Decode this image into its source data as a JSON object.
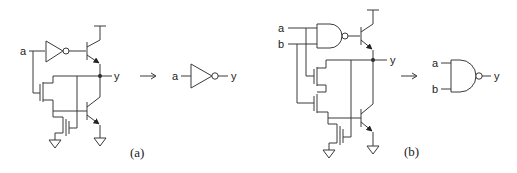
{
  "figure": {
    "panel_a": {
      "caption": "(a)",
      "input_label": "a",
      "output_label": "y",
      "equivalent_symbol": "inverter",
      "equiv_input_label": "a",
      "equiv_output_label": "y",
      "arrow": "→"
    },
    "panel_b": {
      "caption": "(b)",
      "input_labels": [
        "a",
        "b"
      ],
      "output_label": "y",
      "equivalent_symbol": "nand-gate",
      "equiv_input_labels": [
        "a",
        "b"
      ],
      "equiv_output_label": "y",
      "arrow": "→"
    }
  }
}
